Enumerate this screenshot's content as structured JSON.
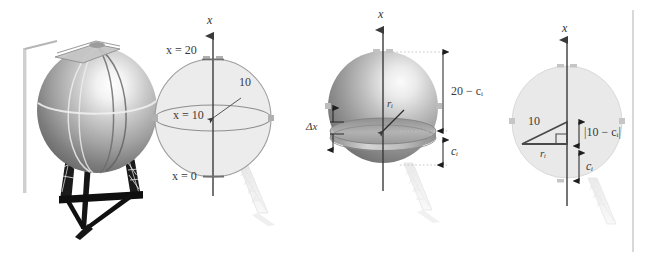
{
  "figure": {
    "background_color": "#ffffff",
    "ink_color": "#3a3a3a",
    "panel_count": 4
  },
  "panels": [
    {
      "id": "photo-panel",
      "name": "water-tower-photograph",
      "description": "Grayscale photograph of a spherical water tower on a steel lattice tripod with an access ladder",
      "labels": []
    },
    {
      "id": "sphere-scale-panel",
      "name": "sphere-with-scale-labels",
      "description": "Outline sphere with vertical x-axis and height markings",
      "axis_label": "x",
      "labels": [
        {
          "key": "top",
          "text": "x = 20",
          "meaning": "top of tank"
        },
        {
          "key": "middle",
          "text": "x = 10",
          "meaning": "equator of tank"
        },
        {
          "key": "bottom",
          "text": "x = 0",
          "meaning": "bottom of tank"
        },
        {
          "key": "radius",
          "text": "10",
          "meaning": "sphere radius"
        }
      ]
    },
    {
      "id": "shaded-slice-panel",
      "name": "sphere-with-representative-slice",
      "description": "Shaded sphere showing a thin horizontal disk slice and dimension callouts",
      "axis_label": "x",
      "labels": [
        {
          "key": "slice_thickness",
          "text": "Δx",
          "meaning": "thickness of representative slice"
        },
        {
          "key": "slice_radius",
          "text": "rᵢ",
          "meaning": "radius of the i-th slice"
        },
        {
          "key": "upper_dim",
          "text": "20 − cᵢ",
          "meaning": "distance from slice to top of tank"
        },
        {
          "key": "lower_dim",
          "text": "cᵢ",
          "meaning": "height of slice above the bottom"
        }
      ]
    },
    {
      "id": "triangle-panel",
      "name": "right-triangle-construction",
      "description": "Sphere cross-section with inscribed right triangle relating radius, height and hypotenuse",
      "axis_label": "x",
      "labels": [
        {
          "key": "hypotenuse",
          "text": "10",
          "meaning": "sphere radius = hypotenuse"
        },
        {
          "key": "base",
          "text": "rᵢ",
          "meaning": "slice radius = triangle base"
        },
        {
          "key": "vertical",
          "text": "|10 − cᵢ|",
          "meaning": "vertical leg of the right triangle"
        },
        {
          "key": "height",
          "text": "cᵢ",
          "meaning": "height of slice above tank bottom"
        }
      ],
      "has_right_angle_mark": true
    }
  ],
  "colors": {
    "ink": "#3a3a3a",
    "sphere_outline": "#9a9a9a",
    "sphere_fill": "#e9e9e9",
    "dimension_line": "#1e1e1e",
    "dotted_guide": "#c2c2c2",
    "divider_rule": "#b9b9b9"
  },
  "divider": {
    "name": "right-edge-rule",
    "visible": true
  }
}
